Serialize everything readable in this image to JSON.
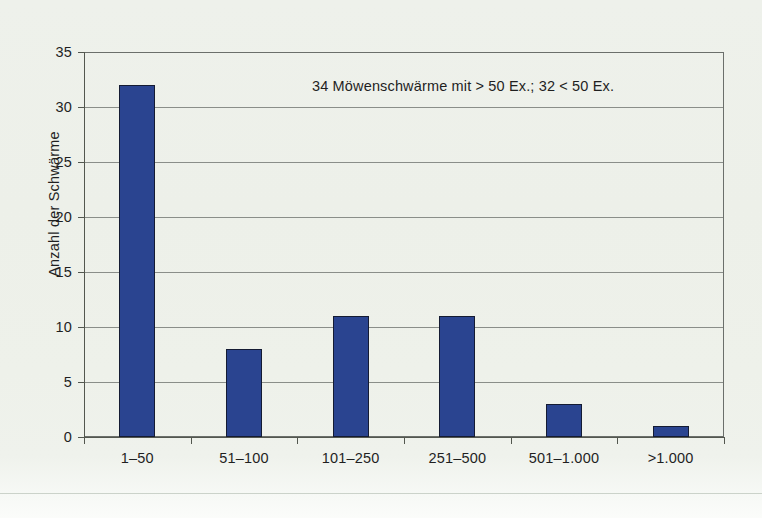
{
  "chart_data": {
    "type": "bar",
    "title": "",
    "subtitle": "",
    "xlabel": "",
    "ylabel": "Anzahl der Schwärme",
    "categories": [
      "1–50",
      "51–100",
      "101–250",
      "251–500",
      "501–1.000",
      ">1.000"
    ],
    "values": [
      32,
      8,
      11,
      11,
      3,
      1
    ],
    "series": [
      {
        "name": "Anzahl der Schwärme",
        "values": [
          32,
          8,
          11,
          11,
          3,
          1
        ],
        "color": "#2a4490"
      }
    ],
    "ylim": [
      0,
      35
    ],
    "ytick_values": [
      0,
      5,
      10,
      15,
      20,
      25,
      30,
      35
    ],
    "ytick_labels": [
      "0",
      "5",
      "10",
      "15",
      "20",
      "25",
      "30",
      "35"
    ],
    "grid": true,
    "grid_axis": "y",
    "legend": false,
    "legend_position": "none",
    "annotations": [
      {
        "text": "34 Möwenschwärme mit > 50 Ex.; 32 < 50 Ex.",
        "x_frac": 0.356,
        "y_value": 33.5
      }
    ]
  },
  "style": {
    "background_color": "#edf0e9",
    "bar_color": "#2a4490",
    "bar_border_color": "#141b33",
    "gridline_color": "#8a8e89",
    "axis_color": "#53574f",
    "plot_border_color": "#6b6f6b",
    "text_color": "#1f1f1f"
  }
}
